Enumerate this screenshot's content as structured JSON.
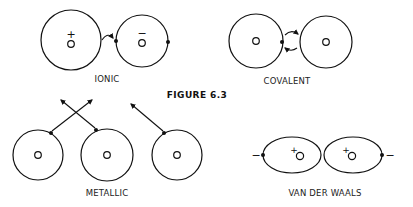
{
  "figure": {
    "title": "FIGURE 6.3",
    "panels": {
      "ionic": {
        "label": "IONIC",
        "atom_left_charge": "+",
        "atom_right_charge": "−"
      },
      "covalent": {
        "label": "COVALENT"
      },
      "metallic": {
        "label": "METALLIC"
      },
      "van_der_waals": {
        "label": "VAN DER WAALS",
        "left_pole": "−",
        "right_pole": "−",
        "nucleus_charge_left": "+",
        "nucleus_charge_right": "+"
      }
    },
    "colors": {
      "ink": "#111111",
      "background": "#ffffff"
    }
  }
}
